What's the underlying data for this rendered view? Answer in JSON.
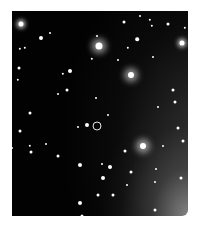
{
  "image": {
    "subject": "star field",
    "background_color": "#020202",
    "page_color": "#ffffff",
    "frame": {
      "x": 12,
      "y": 11,
      "width": 176,
      "height": 205
    }
  },
  "marker": {
    "shape": "circle",
    "x": 97,
    "y": 126,
    "diameter": 9,
    "color": "#e8e8e8"
  },
  "stars": [
    {
      "x": 21,
      "y": 24,
      "r": 2.5,
      "glow": "glow"
    },
    {
      "x": 99,
      "y": 46,
      "r": 3.5,
      "glow": "bigglow"
    },
    {
      "x": 131,
      "y": 75,
      "r": 3,
      "glow": "bigglow"
    },
    {
      "x": 182,
      "y": 43,
      "r": 2.5,
      "glow": "glow"
    },
    {
      "x": 143,
      "y": 146,
      "r": 3,
      "glow": "bigglow"
    },
    {
      "x": 124,
      "y": 22,
      "r": 1.5,
      "glow": ""
    },
    {
      "x": 140,
      "y": 16,
      "r": 1,
      "glow": ""
    },
    {
      "x": 150,
      "y": 20,
      "r": 1.2,
      "glow": ""
    },
    {
      "x": 152,
      "y": 26,
      "r": 1.2,
      "glow": ""
    },
    {
      "x": 168,
      "y": 24,
      "r": 1.5,
      "glow": ""
    },
    {
      "x": 185,
      "y": 28,
      "r": 1.2,
      "glow": ""
    },
    {
      "x": 41,
      "y": 38,
      "r": 2,
      "glow": ""
    },
    {
      "x": 50,
      "y": 33,
      "r": 1,
      "glow": ""
    },
    {
      "x": 137,
      "y": 39,
      "r": 1.8,
      "glow": ""
    },
    {
      "x": 128,
      "y": 48,
      "r": 1.2,
      "glow": ""
    },
    {
      "x": 20,
      "y": 49,
      "r": 1.2,
      "glow": ""
    },
    {
      "x": 25,
      "y": 48,
      "r": 1.2,
      "glow": ""
    },
    {
      "x": 97,
      "y": 36,
      "r": 1,
      "glow": ""
    },
    {
      "x": 92,
      "y": 59,
      "r": 1.2,
      "glow": ""
    },
    {
      "x": 118,
      "y": 60,
      "r": 1,
      "glow": ""
    },
    {
      "x": 153,
      "y": 57,
      "r": 1,
      "glow": ""
    },
    {
      "x": 19,
      "y": 68,
      "r": 1.5,
      "glow": ""
    },
    {
      "x": 18,
      "y": 80,
      "r": 1.2,
      "glow": ""
    },
    {
      "x": 63,
      "y": 74,
      "r": 1.2,
      "glow": ""
    },
    {
      "x": 70,
      "y": 71,
      "r": 2,
      "glow": ""
    },
    {
      "x": 67,
      "y": 90,
      "r": 1.5,
      "glow": ""
    },
    {
      "x": 58,
      "y": 94,
      "r": 1,
      "glow": ""
    },
    {
      "x": 96,
      "y": 98,
      "r": 1,
      "glow": ""
    },
    {
      "x": 173,
      "y": 90,
      "r": 1.5,
      "glow": ""
    },
    {
      "x": 175,
      "y": 102,
      "r": 1.5,
      "glow": ""
    },
    {
      "x": 158,
      "y": 107,
      "r": 1,
      "glow": ""
    },
    {
      "x": 30,
      "y": 113,
      "r": 1.5,
      "glow": ""
    },
    {
      "x": 108,
      "y": 115,
      "r": 1,
      "glow": ""
    },
    {
      "x": 87,
      "y": 125,
      "r": 2,
      "glow": ""
    },
    {
      "x": 20,
      "y": 131,
      "r": 1.5,
      "glow": ""
    },
    {
      "x": 78,
      "y": 127,
      "r": 1,
      "glow": ""
    },
    {
      "x": 178,
      "y": 128,
      "r": 1.5,
      "glow": ""
    },
    {
      "x": 183,
      "y": 141,
      "r": 1.5,
      "glow": ""
    },
    {
      "x": 30,
      "y": 146,
      "r": 1.2,
      "glow": ""
    },
    {
      "x": 31,
      "y": 152,
      "r": 1.5,
      "glow": ""
    },
    {
      "x": 46,
      "y": 144,
      "r": 1,
      "glow": ""
    },
    {
      "x": 58,
      "y": 156,
      "r": 1.5,
      "glow": ""
    },
    {
      "x": 125,
      "y": 151,
      "r": 1.5,
      "glow": ""
    },
    {
      "x": 163,
      "y": 146,
      "r": 1,
      "glow": ""
    },
    {
      "x": 80,
      "y": 165,
      "r": 2,
      "glow": ""
    },
    {
      "x": 110,
      "y": 167,
      "r": 2,
      "glow": ""
    },
    {
      "x": 102,
      "y": 164,
      "r": 1,
      "glow": ""
    },
    {
      "x": 131,
      "y": 172,
      "r": 1.5,
      "glow": ""
    },
    {
      "x": 103,
      "y": 178,
      "r": 2,
      "glow": ""
    },
    {
      "x": 156,
      "y": 169,
      "r": 1,
      "glow": ""
    },
    {
      "x": 181,
      "y": 178,
      "r": 1.5,
      "glow": ""
    },
    {
      "x": 127,
      "y": 185,
      "r": 1,
      "glow": ""
    },
    {
      "x": 98,
      "y": 195,
      "r": 1.5,
      "glow": ""
    },
    {
      "x": 113,
      "y": 195,
      "r": 1.5,
      "glow": ""
    },
    {
      "x": 155,
      "y": 182,
      "r": 1,
      "glow": ""
    },
    {
      "x": 80,
      "y": 203,
      "r": 2,
      "glow": ""
    },
    {
      "x": 82,
      "y": 216,
      "r": 1.5,
      "glow": ""
    },
    {
      "x": 155,
      "y": 210,
      "r": 1.5,
      "glow": ""
    },
    {
      "x": 12,
      "y": 148,
      "r": 1,
      "glow": ""
    }
  ]
}
